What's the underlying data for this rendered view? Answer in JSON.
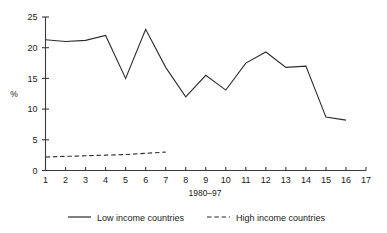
{
  "chart_data": {
    "type": "line",
    "title": "",
    "subtitle": "",
    "xlabel": "1980–97",
    "ylabel": "%",
    "x": [
      1,
      2,
      3,
      4,
      5,
      6,
      7,
      8,
      9,
      10,
      11,
      12,
      13,
      14,
      15,
      16,
      17
    ],
    "xticklabels": [
      "1",
      "2",
      "3",
      "4",
      "5",
      "6",
      "7",
      "8",
      "9",
      "10",
      "11",
      "12",
      "13",
      "14",
      "15",
      "16",
      "17"
    ],
    "xlim": [
      1,
      17
    ],
    "ylim": [
      0,
      25
    ],
    "yticks": [
      0,
      5,
      10,
      15,
      20,
      25
    ],
    "yticklabels": [
      "0",
      "5",
      "10",
      "15",
      "20",
      "25"
    ],
    "grid": false,
    "legend_position": "bottom",
    "series": [
      {
        "name": "Low income countries",
        "style": "solid",
        "color": "#2b2b2b",
        "x": [
          1,
          2,
          3,
          4,
          5,
          6,
          7,
          8,
          9,
          10,
          11,
          12,
          13,
          14,
          15,
          16
        ],
        "values": [
          21.3,
          21.0,
          21.2,
          22.0,
          15.0,
          23.0,
          16.8,
          12.0,
          15.5,
          13.1,
          17.5,
          19.3,
          16.8,
          17.0,
          8.7,
          8.2
        ]
      },
      {
        "name": "High income countries",
        "style": "dashed",
        "color": "#2b2b2b",
        "x": [
          1,
          2,
          3,
          4,
          5,
          6,
          7
        ],
        "values": [
          2.2,
          2.3,
          2.4,
          2.5,
          2.6,
          2.8,
          3.0
        ]
      }
    ]
  },
  "legend": {
    "items": [
      {
        "label": "Low income countries",
        "style": "solid"
      },
      {
        "label": "High income countries",
        "style": "dashed"
      }
    ]
  }
}
